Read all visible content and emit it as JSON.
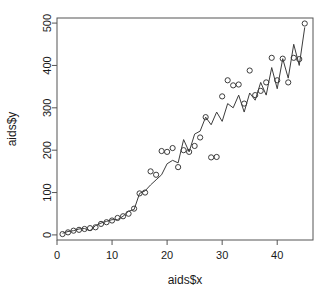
{
  "chart_data": {
    "type": "scatter",
    "title": "",
    "xlabel": "aids$x",
    "ylabel": "aids$y",
    "xlim": [
      0,
      46.5
    ],
    "ylim": [
      -12,
      512
    ],
    "xticks": [
      0,
      10,
      20,
      30,
      40
    ],
    "yticks": [
      0,
      100,
      200,
      300,
      400,
      500
    ],
    "grid": false,
    "legend": null,
    "box": "full",
    "point_symbol": "open-circle",
    "point_color": "#3c3c3c",
    "line_color": "#3c3c3c",
    "series": [
      {
        "name": "observed",
        "render": "points",
        "x": [
          1,
          2,
          3,
          4,
          5,
          6,
          7,
          8,
          9,
          10,
          11,
          12,
          13,
          14,
          15,
          16,
          17,
          18,
          19,
          20,
          21,
          22,
          23,
          24,
          25,
          26,
          27,
          28,
          29,
          30,
          31,
          32,
          33,
          34,
          35,
          36,
          37,
          38,
          39,
          40,
          41,
          42,
          43,
          44,
          45
        ],
        "values": [
          2,
          6,
          10,
          12,
          14,
          16,
          18,
          26,
          30,
          34,
          40,
          44,
          50,
          62,
          98,
          100,
          150,
          142,
          198,
          196,
          205,
          160,
          200,
          196,
          210,
          230,
          278,
          183,
          184,
          327,
          365,
          353,
          355,
          310,
          388,
          330,
          340,
          360,
          418,
          365,
          416,
          360,
          418,
          415,
          499
        ]
      },
      {
        "name": "fitted",
        "render": "line",
        "x": [
          1,
          2,
          3,
          4,
          5,
          6,
          7,
          8,
          9,
          10,
          11,
          12,
          13,
          14,
          15,
          16,
          17,
          18,
          19,
          20,
          21,
          22,
          23,
          24,
          25,
          26,
          27,
          28,
          29,
          30,
          31,
          32,
          33,
          34,
          35,
          36,
          37,
          38,
          39,
          40,
          41,
          42,
          43,
          44,
          45
        ],
        "values": [
          4,
          8,
          10,
          14,
          15,
          10,
          22,
          28,
          32,
          36,
          36,
          44,
          56,
          60,
          98,
          104,
          118,
          130,
          142,
          168,
          176,
          170,
          225,
          196,
          238,
          245,
          278,
          260,
          290,
          268,
          310,
          300,
          330,
          290,
          335,
          318,
          360,
          330,
          395,
          345,
          416,
          370,
          450,
          400,
          490
        ]
      }
    ]
  }
}
